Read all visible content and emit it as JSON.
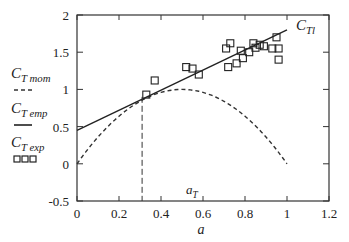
{
  "chart_data": {
    "type": "line",
    "title": "",
    "xlabel": "a",
    "ylabel": "",
    "xlim": [
      0,
      1.2
    ],
    "ylim": [
      -0.5,
      2
    ],
    "x_ticks": [
      "0",
      "0.2",
      "0.4",
      "0.6",
      "0.8",
      "1",
      "1.2"
    ],
    "y_ticks": [
      "-0.5",
      "0",
      "0.5",
      "1",
      "1.5",
      "2"
    ],
    "legend": [
      {
        "label": "C_T mom",
        "style": "dashed"
      },
      {
        "label": "C_T emp",
        "style": "solid"
      },
      {
        "label": "C_T exp",
        "style": "squares"
      }
    ],
    "annotations": [
      {
        "text": "C_TI",
        "x": 1.0,
        "y": 1.8
      },
      {
        "text": "a_T",
        "x": 0.31,
        "y": 0.15
      }
    ],
    "series": [
      {
        "name": "C_T mom",
        "x": [
          0,
          0.1,
          0.2,
          0.3,
          0.4,
          0.5,
          0.6,
          0.7,
          0.8,
          0.9,
          1.0
        ],
        "y": [
          0,
          0.36,
          0.64,
          0.84,
          0.96,
          1.0,
          0.96,
          0.84,
          0.64,
          0.36,
          0.0
        ]
      },
      {
        "name": "C_T emp",
        "x": [
          0,
          0.31,
          1.0
        ],
        "y": [
          0.45,
          0.9,
          1.8
        ]
      },
      {
        "name": "C_T exp",
        "x": [
          0.33,
          0.37,
          0.52,
          0.55,
          0.58,
          0.71,
          0.73,
          0.72,
          0.76,
          0.78,
          0.79,
          0.82,
          0.84,
          0.85,
          0.87,
          0.89,
          0.93,
          0.95,
          0.96,
          0.96
        ],
        "y": [
          0.93,
          1.12,
          1.3,
          1.28,
          1.2,
          1.55,
          1.62,
          1.3,
          1.35,
          1.52,
          1.42,
          1.5,
          1.62,
          1.56,
          1.6,
          1.58,
          1.55,
          1.7,
          1.55,
          1.4
        ]
      }
    ],
    "grid": false,
    "legend_position": "left"
  },
  "labels": {
    "x_axis": "a",
    "ct_tl": "C",
    "ct_tl_sub": "Tl",
    "a_t": "a",
    "a_t_sub": "T",
    "legend_mom": "C",
    "legend_mom_sub": "T mom",
    "legend_emp": "C",
    "legend_emp_sub": "T emp",
    "legend_exp": "C",
    "legend_exp_sub": "T exp",
    "squares": "□□□"
  }
}
